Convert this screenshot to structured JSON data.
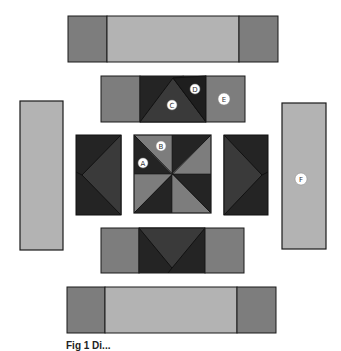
{
  "diagram": {
    "colors": {
      "light": "#b3b3b3",
      "medium": "#7d7d7d",
      "dark": "#3a3a3a",
      "darkest": "#242424",
      "outline": "#1a1a1a",
      "label_bg": "#ffffff"
    },
    "labels": {
      "A": "A",
      "B": "B",
      "C": "C",
      "D": "D",
      "E": "E",
      "F": "F"
    },
    "caption": "Fig 1 Di..."
  }
}
